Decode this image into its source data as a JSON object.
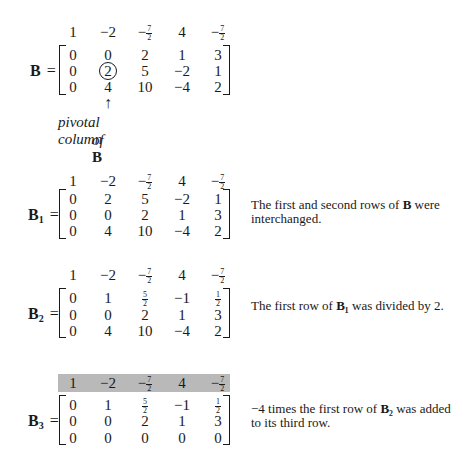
{
  "header_row": [
    "1",
    "-2",
    "-7/2",
    "4",
    "-7/2"
  ],
  "header_row_display": [
    {
      "type": "int",
      "text": "1"
    },
    {
      "type": "int",
      "text": "−2"
    },
    {
      "type": "frac",
      "sign": "−",
      "num": "7",
      "den": "2"
    },
    {
      "type": "int",
      "text": "4"
    },
    {
      "type": "frac",
      "sign": "−",
      "num": "7",
      "den": "2"
    }
  ],
  "steps": [
    {
      "name": "B",
      "label": "B",
      "sub": "",
      "rows": [
        [
          "0",
          "0",
          "2",
          "1",
          "3"
        ],
        [
          "0",
          "2",
          "5",
          "-2",
          "1"
        ],
        [
          "0",
          "4",
          "10",
          "-4",
          "2"
        ]
      ],
      "circled": [
        1,
        1
      ],
      "note": "",
      "annotation": {
        "arrow": "↑",
        "line1": "pivotal column",
        "line2_prefix": "of ",
        "line2_bold": "B"
      }
    },
    {
      "name": "B1",
      "label": "B",
      "sub": "1",
      "rows": [
        [
          "0",
          "2",
          "5",
          "-2",
          "1"
        ],
        [
          "0",
          "0",
          "2",
          "1",
          "3"
        ],
        [
          "0",
          "4",
          "10",
          "-4",
          "2"
        ]
      ],
      "note_parts": [
        "The first and second rows of ",
        "B",
        " were interchanged."
      ]
    },
    {
      "name": "B2",
      "label": "B",
      "sub": "2",
      "rows": [
        [
          "0",
          "1",
          "5/2",
          "-1",
          "1/2"
        ],
        [
          "0",
          "0",
          "2",
          "1",
          "3"
        ],
        [
          "0",
          "4",
          "10",
          "-4",
          "2"
        ]
      ],
      "note_parts": [
        "The first row of ",
        "B₁",
        " was divided by 2."
      ]
    },
    {
      "name": "B3",
      "label": "B",
      "sub": "3",
      "header_shaded": true,
      "rows": [
        [
          "0",
          "1",
          "5/2",
          "-1",
          "1/2"
        ],
        [
          "0",
          "0",
          "2",
          "1",
          "3"
        ],
        [
          "0",
          "0",
          "0",
          "0",
          "0"
        ]
      ],
      "note_parts": [
        "−4 times the first row of ",
        "B₂",
        " was added to its third row."
      ]
    }
  ],
  "colors": {
    "text": "#1a1a1a",
    "shade": "#b9b9b9",
    "background": "#ffffff"
  }
}
